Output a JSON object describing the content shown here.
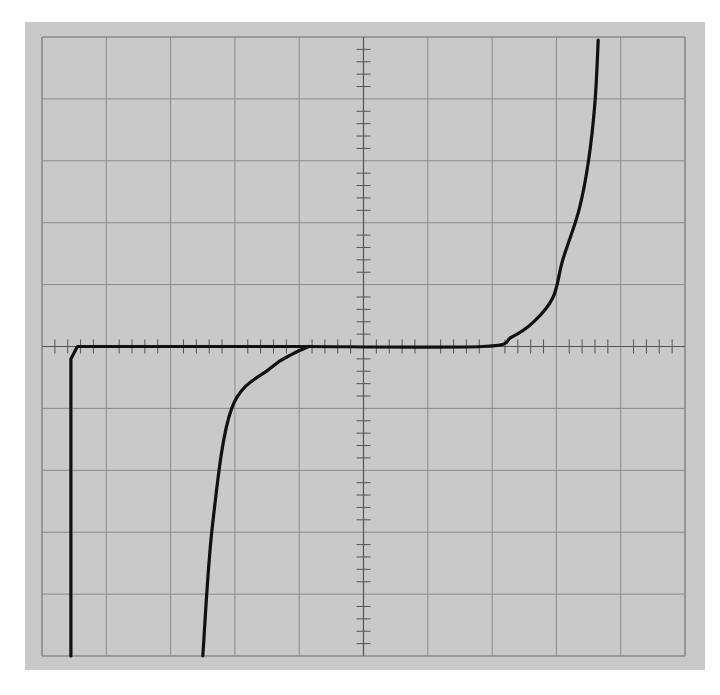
{
  "chart_data": {
    "type": "line",
    "title": "",
    "xlabel": "",
    "ylabel": "",
    "grid": {
      "on": true,
      "x_divisions": 10,
      "y_divisions": 10,
      "minor_ticks_per_division": 5
    },
    "xlim": [
      -5,
      5
    ],
    "ylim": [
      -5,
      5
    ],
    "colors": {
      "background": "#c9c9c9",
      "grid": "#8a8a8a",
      "trace": "#111111"
    },
    "series": [
      {
        "name": "trace-left-step",
        "points": [
          [
            -4.55,
            -5.0
          ],
          [
            -4.55,
            -0.2
          ],
          [
            -4.45,
            0.0
          ],
          [
            -0.85,
            0.0
          ]
        ]
      },
      {
        "name": "trace-center-knee",
        "points": [
          [
            -2.5,
            -5.0
          ],
          [
            -2.35,
            -2.9
          ],
          [
            -2.05,
            -1.0
          ],
          [
            -1.45,
            -0.35
          ],
          [
            -1.1,
            -0.12
          ],
          [
            -0.85,
            0.0
          ]
        ]
      },
      {
        "name": "trace-right-rise",
        "points": [
          [
            -0.85,
            0.0
          ],
          [
            1.85,
            0.0
          ],
          [
            2.3,
            0.15
          ],
          [
            2.65,
            0.4
          ],
          [
            2.95,
            0.8
          ],
          [
            3.1,
            1.4
          ],
          [
            3.35,
            2.2
          ],
          [
            3.5,
            3.0
          ],
          [
            3.6,
            3.95
          ],
          [
            3.65,
            4.95
          ]
        ]
      }
    ]
  },
  "screen": {
    "label": "Oscilloscope graticule"
  }
}
